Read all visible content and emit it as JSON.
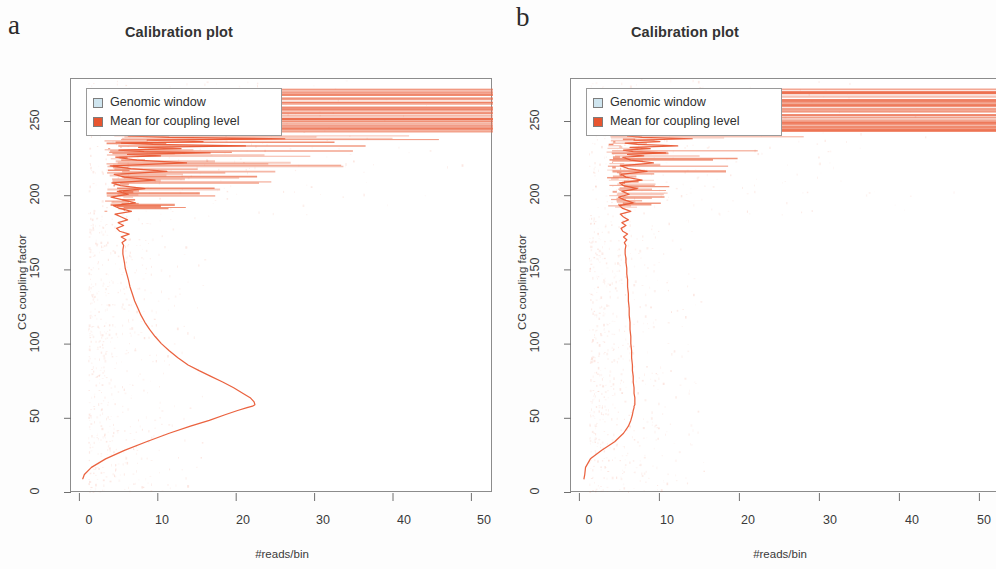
{
  "figure": {
    "panels": [
      {
        "letter": "a",
        "title": "Calibration plot",
        "xlabel": "#reads/bin",
        "ylabel": "CG coupling factor",
        "legend": {
          "items": [
            {
              "label": "Genomic window",
              "color": "#cfe5ef"
            },
            {
              "label": "Mean for coupling level",
              "color": "#e8552f"
            }
          ]
        }
      },
      {
        "letter": "b",
        "title": "Calibration plot",
        "xlabel": "#reads/bin",
        "ylabel": "CG coupling factor",
        "legend": {
          "items": [
            {
              "label": "Genomic window",
              "color": "#cfe5ef"
            },
            {
              "label": "Mean for coupling level",
              "color": "#e8552f"
            }
          ]
        }
      }
    ]
  },
  "chart_data": [
    {
      "type": "line",
      "panel": "a",
      "title": "Calibration plot",
      "xlabel": "#reads/bin",
      "ylabel": "CG coupling factor",
      "xlim": [
        -1.2,
        52.5
      ],
      "ylim": [
        -10,
        281
      ],
      "xticks": [
        0,
        10,
        20,
        30,
        40,
        50
      ],
      "yticks": [
        0,
        50,
        100,
        150,
        200,
        250
      ],
      "grid": false,
      "legend_position": "top-left",
      "series": [
        {
          "name": "Mean for coupling level",
          "color": "#e8552f",
          "description": "Mean #reads/bin plotted against CG coupling factor; rises from ~0.3 reads at coupling 0 to a peak of ~22 reads at coupling ~52, falls back to ~5 reads by coupling ~130, then becomes noisy and fans out above coupling ~190.",
          "x": [
            0.3,
            0.5,
            1.4,
            3.2,
            5.6,
            8.4,
            11.3,
            14.0,
            16.4,
            18.4,
            20.0,
            21.2,
            21.9,
            22.2,
            22.1,
            21.6,
            20.7,
            19.5,
            18.1,
            16.6,
            15.1,
            13.7,
            12.4,
            11.3,
            10.3,
            9.5,
            8.8,
            8.2,
            7.7,
            7.3,
            6.9,
            6.6,
            6.3,
            6.1,
            5.9,
            5.7,
            5.6,
            5.5,
            5.4,
            5.4,
            5.5,
            5.3,
            5.8,
            5.2,
            6.2,
            5.0,
            4.6,
            5.5,
            4.8,
            6.0,
            5.2,
            4.4,
            6.5,
            5.0,
            4.2,
            7.0,
            5.4,
            3.9,
            6.1,
            4.7,
            8.2,
            5.1,
            4.0,
            9.5,
            5.6,
            4.3,
            11.0,
            6.4,
            3.8,
            13.5,
            7.2,
            4.5,
            10.2,
            6.0,
            16.5,
            8.1,
            4.9,
            12.8,
            7.4,
            21.0,
            9.2,
            5.2,
            15.6,
            8.5,
            26.0,
            11.3,
            6.1,
            18.0
          ],
          "y": [
            0,
            3,
            8,
            14,
            20,
            26,
            32,
            37,
            41,
            45,
            48,
            50,
            51,
            52,
            54,
            57,
            60,
            64,
            68,
            72,
            76,
            80,
            85,
            90,
            95,
            100,
            105,
            110,
            115,
            120,
            125,
            130,
            135,
            140,
            144,
            148,
            152,
            155,
            158,
            161,
            164,
            166,
            168,
            170,
            172,
            174,
            176,
            178,
            180,
            182,
            184,
            186,
            188,
            190,
            192,
            194,
            196,
            198,
            200,
            202,
            204,
            206,
            208,
            210,
            212,
            214,
            216,
            218,
            220,
            222,
            224,
            226,
            227,
            228,
            229,
            230,
            231,
            232,
            233,
            234,
            235,
            236,
            237,
            238,
            239,
            240,
            241,
            242
          ]
        },
        {
          "name": "Genomic window whiskers (high coupling, off-scale)",
          "color": "#f08060",
          "description": "Long horizontal spans at coupling factor > 240 that extend to and beyond the right plot edge.",
          "y_values": [
            244,
            246,
            248,
            250,
            251,
            252,
            253,
            255,
            257,
            259,
            261,
            264,
            267,
            270,
            272
          ],
          "x_extent": 52.5
        }
      ]
    },
    {
      "type": "line",
      "panel": "b",
      "title": "Calibration plot",
      "xlabel": "#reads/bin",
      "ylabel": "CG coupling factor",
      "xlim": [
        -1.2,
        52.5
      ],
      "ylim": [
        -10,
        281
      ],
      "xticks": [
        0,
        10,
        20,
        30,
        40,
        50
      ],
      "yticks": [
        0,
        50,
        100,
        150,
        200,
        250
      ],
      "grid": false,
      "legend_position": "top-left",
      "series": [
        {
          "name": "Mean for coupling level",
          "color": "#e8552f",
          "description": "After correction the mean #reads/bin is nearly flat at ~6 reads across the whole coupling-factor range, rising only slightly at very low and very high coupling values.",
          "x": [
            0.4,
            0.5,
            0.6,
            1.2,
            2.6,
            4.2,
            5.3,
            5.9,
            6.2,
            6.4,
            6.5,
            6.6,
            6.6,
            6.7,
            6.7,
            6.7,
            6.6,
            6.6,
            6.5,
            6.5,
            6.4,
            6.4,
            6.3,
            6.3,
            6.2,
            6.2,
            6.1,
            6.1,
            6.0,
            6.0,
            5.9,
            5.9,
            5.8,
            5.8,
            5.7,
            5.7,
            5.6,
            5.6,
            5.5,
            5.5,
            5.6,
            5.4,
            5.7,
            5.3,
            5.8,
            5.2,
            5.0,
            5.6,
            5.1,
            5.9,
            5.3,
            4.9,
            6.2,
            5.2,
            4.8,
            6.5,
            5.4,
            4.7,
            6.0,
            5.1,
            7.0,
            5.3,
            4.8,
            7.6,
            5.6,
            5.0,
            8.2,
            5.9,
            4.9,
            9.0,
            6.2,
            5.2,
            7.8,
            5.8,
            10.5,
            6.5,
            5.3,
            8.6,
            6.1,
            12.0,
            7.0,
            5.5,
            9.8,
            6.6,
            13.8,
            7.6,
            5.8,
            10.5
          ],
          "y": [
            0,
            3,
            8,
            14,
            20,
            26,
            32,
            37,
            41,
            45,
            48,
            50,
            51,
            52,
            54,
            57,
            60,
            64,
            68,
            72,
            76,
            80,
            85,
            90,
            95,
            100,
            105,
            110,
            115,
            120,
            125,
            130,
            135,
            140,
            144,
            148,
            152,
            155,
            158,
            161,
            164,
            166,
            168,
            170,
            172,
            174,
            176,
            178,
            180,
            182,
            184,
            186,
            188,
            190,
            192,
            194,
            196,
            198,
            200,
            202,
            204,
            206,
            208,
            210,
            212,
            214,
            216,
            218,
            220,
            222,
            224,
            226,
            227,
            228,
            229,
            230,
            231,
            232,
            233,
            234,
            235,
            236,
            237,
            238,
            239,
            240,
            241,
            242
          ]
        },
        {
          "name": "Genomic window whiskers (high coupling, off-scale)",
          "color": "#f08060",
          "description": "Long horizontal spans at coupling factor > 243 reaching the right plot edge; below that the whiskers are short, extending only to ~12 reads.",
          "y_values": [
            245,
            247,
            249,
            250,
            252,
            254,
            256,
            258,
            260,
            263,
            266,
            269,
            271
          ],
          "x_extent": 52.5
        }
      ]
    }
  ]
}
